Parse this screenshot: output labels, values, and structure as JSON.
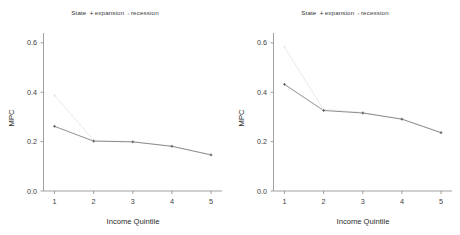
{
  "figure": {
    "panel_count": 2,
    "background": "#ffffff"
  },
  "legend": {
    "title": "State",
    "separator": "",
    "entries": [
      {
        "label": "expansion",
        "marker": "plus-marker-icon",
        "color": "#4a4a4a"
      },
      {
        "label": "recession",
        "marker": "dot-marker-icon",
        "color": "#e2e2e2"
      }
    ]
  },
  "axes": {
    "xlabel": "Income Quintile",
    "ylabel": "MPC",
    "xticks": [
      "1",
      "2",
      "3",
      "4",
      "5"
    ],
    "yticks": [
      "0.0",
      "0.2",
      "0.4",
      "0.6"
    ]
  },
  "chart_data": [
    {
      "type": "line",
      "panel": "left",
      "title": "",
      "xlabel": "Income Quintile",
      "ylabel": "MPC",
      "x": [
        1,
        2,
        3,
        4,
        5
      ],
      "categories": [
        "1",
        "2",
        "3",
        "4",
        "5"
      ],
      "xlim": [
        0.72,
        5.28
      ],
      "ylim": [
        0.0,
        0.64
      ],
      "xtick_values": [
        1,
        2,
        3,
        4,
        5
      ],
      "ytick_values": [
        0.0,
        0.2,
        0.4,
        0.6
      ],
      "grid": false,
      "legend_position": "top",
      "series": [
        {
          "name": "expansion",
          "color": "#6b6b6b",
          "values": [
            0.262,
            0.202,
            0.199,
            0.181,
            0.146
          ]
        },
        {
          "name": "recession",
          "color": "#e2e2e2",
          "values": [
            0.388,
            0.205,
            0.2,
            0.182,
            0.148
          ]
        }
      ]
    },
    {
      "type": "line",
      "panel": "right",
      "title": "",
      "xlabel": "Income Quintile",
      "ylabel": "MPC",
      "x": [
        1,
        2,
        3,
        4,
        5
      ],
      "categories": [
        "1",
        "2",
        "3",
        "4",
        "5"
      ],
      "xlim": [
        0.72,
        5.28
      ],
      "ylim": [
        0.0,
        0.64
      ],
      "xtick_values": [
        1,
        2,
        3,
        4,
        5
      ],
      "ytick_values": [
        0.0,
        0.2,
        0.4,
        0.6
      ],
      "grid": false,
      "legend_position": "top",
      "series": [
        {
          "name": "expansion",
          "color": "#6b6b6b",
          "values": [
            0.432,
            0.326,
            0.316,
            0.291,
            0.236
          ]
        },
        {
          "name": "recession",
          "color": "#e2e2e2",
          "values": [
            0.583,
            0.33,
            0.318,
            0.292,
            0.238
          ]
        }
      ]
    }
  ]
}
